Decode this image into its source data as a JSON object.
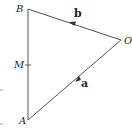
{
  "diagram": {
    "type": "vector-triangle",
    "points": {
      "B": {
        "label": "B",
        "x": 28,
        "y": 9
      },
      "O": {
        "label": "O",
        "x": 121,
        "y": 40
      },
      "A": {
        "label": "A",
        "x": 28,
        "y": 120
      },
      "M": {
        "label": "M",
        "x": 28,
        "y": 65
      }
    },
    "edges": [
      {
        "from": "O",
        "to": "B",
        "vector_label": "b",
        "arrow": true
      },
      {
        "from": "O",
        "to": "A",
        "vector_label": "a",
        "arrow": true
      },
      {
        "from": "B",
        "to": "A",
        "vector_label": "",
        "arrow": false
      }
    ],
    "line_color": "#555555",
    "text_color": "#222222"
  }
}
